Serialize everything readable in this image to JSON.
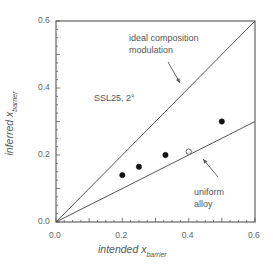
{
  "chart_data": {
    "type": "scatter",
    "title": "",
    "xlabel": "intended x_barrier",
    "ylabel": "inferred x_barrier",
    "xlabel_main": "intended x",
    "ylabel_main": "inferred x",
    "label_subscript": "barrier",
    "xlim": [
      0.0,
      0.6
    ],
    "ylim": [
      0.0,
      0.6
    ],
    "xticks": [
      "0.0",
      "0.2",
      "0.4",
      "0.6"
    ],
    "yticks": [
      "0.0",
      "0.2",
      "0.4",
      "0.6"
    ],
    "grid": false,
    "legend": null,
    "series": [
      {
        "name": "measured (filled)",
        "marker": "filled-circle",
        "x": [
          0.2,
          0.25,
          0.33,
          0.5
        ],
        "y": [
          0.14,
          0.165,
          0.2,
          0.3
        ]
      },
      {
        "name": "measured (open)",
        "marker": "open-circle",
        "x": [
          0.4
        ],
        "y": [
          0.21
        ]
      },
      {
        "name": "ideal composition modulation",
        "type": "line",
        "x": [
          0.0,
          0.6
        ],
        "y": [
          0.0,
          0.6
        ]
      },
      {
        "name": "uniform alloy",
        "type": "line",
        "x": [
          0.0,
          0.6
        ],
        "y": [
          0.0,
          0.3
        ]
      }
    ],
    "annotations": [
      {
        "text": "ideal composition modulation",
        "arrow_to": "ideal line"
      },
      {
        "text": "uniform alloy",
        "arrow_to": "uniform alloy line"
      },
      {
        "text": "SSL25, 2°"
      }
    ]
  },
  "labels": {
    "ideal_line1": "ideal composition",
    "ideal_line2": "modulation",
    "uniform_line1": "uniform",
    "uniform_line2": "alloy",
    "sample": "SSL25, 2°"
  }
}
